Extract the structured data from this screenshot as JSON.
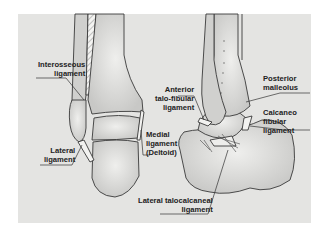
{
  "figure": {
    "background_color": "#e4e4e2",
    "bone_fill": "#d2d2d0",
    "bone_highlight": "#ececea",
    "outline_color": "#3a3a3a",
    "views": [
      {
        "name": "posterior-view",
        "bones": [
          "tibia",
          "fibula",
          "talus",
          "calcaneus"
        ]
      },
      {
        "name": "lateral-view",
        "bones": [
          "tibia",
          "fibula",
          "talus",
          "calcaneus"
        ]
      }
    ]
  },
  "labels": {
    "interosseous": {
      "line1": "Interosseous",
      "line2": "ligament"
    },
    "lateral": {
      "line1": "Lateral",
      "line2": "ligament"
    },
    "anterior_talofibular": {
      "line1": "Anterior",
      "line2": "talo-fibular",
      "line3": "ligament"
    },
    "medial_deltoid": {
      "line1": "Medial",
      "line2": "ligament",
      "line3": "(Deltoid)"
    },
    "posterior_malleolus": {
      "line1": "Posterior",
      "line2": "malleolus"
    },
    "calcaneofibular": {
      "line1": "Calcaneo",
      "line2": "fibular",
      "line3": "ligament"
    },
    "lateral_talocalcaneal": {
      "line1": "Lateral talocalcaneal",
      "line2": "ligament"
    }
  }
}
